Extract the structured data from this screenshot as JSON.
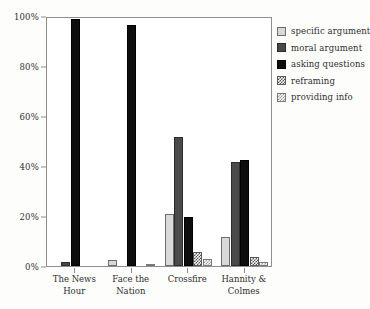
{
  "chart_data": {
    "type": "bar",
    "title": "",
    "subtitle": "",
    "xlabel": "",
    "ylabel": "",
    "ylim": [
      0,
      100
    ],
    "grid": false,
    "legend_position": "right",
    "categories": [
      "The News Hour",
      "Face the Nation",
      "Crossfire",
      "Hannity & Colmes"
    ],
    "category_lines": [
      [
        "The News",
        "Hour"
      ],
      [
        "Face the",
        "Nation"
      ],
      [
        "Crossfire",
        ""
      ],
      [
        "Hannity &",
        "Colmes"
      ]
    ],
    "ytick_labels": [
      "0%",
      "20%",
      "40%",
      "60%",
      "80%",
      "100%"
    ],
    "ytick_values": [
      0,
      20,
      40,
      60,
      80,
      100
    ],
    "series": [
      {
        "name": "specific argument",
        "key": "specific",
        "color": "#d9d9d9",
        "values": [
          0,
          2.5,
          21,
          11.5
        ]
      },
      {
        "name": "moral argument",
        "key": "moral",
        "color": "#4a4a4a",
        "values": [
          1.5,
          0,
          51.5,
          41.5
        ]
      },
      {
        "name": "asking questions",
        "key": "asking",
        "color": "#0d0d0d",
        "values": [
          99,
          96.5,
          19.5,
          42.5
        ]
      },
      {
        "name": "reframing",
        "key": "reframing",
        "color": "#555555",
        "values": [
          0,
          0,
          5.5,
          3.5
        ]
      },
      {
        "name": "providing info",
        "key": "providing",
        "color": "#9a9a9a",
        "values": [
          0,
          0.8,
          3,
          1.5
        ]
      }
    ]
  },
  "axis": {
    "frame_color": "#8e8e8e"
  }
}
